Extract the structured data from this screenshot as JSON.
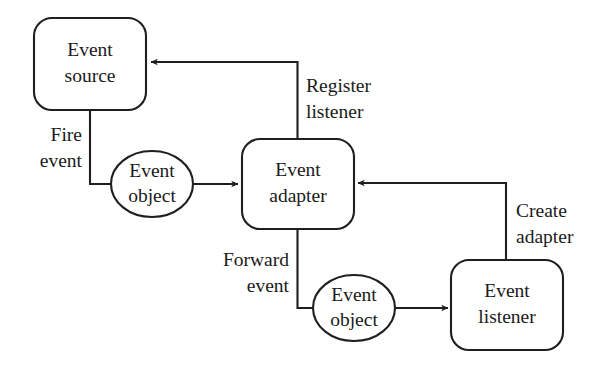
{
  "diagram": {
    "type": "flow-diagram",
    "background_color": "#ffffff",
    "line_color": "#1f1f1f",
    "text_color": "#1a1a1a",
    "nodes": [
      {
        "id": "event-source",
        "shape": "rounded-rectangle",
        "line1": "Event",
        "line2": "source"
      },
      {
        "id": "event-adapter",
        "shape": "rounded-rectangle",
        "line1": "Event",
        "line2": "adapter"
      },
      {
        "id": "event-listener",
        "shape": "rounded-rectangle",
        "line1": "Event",
        "line2": "listener"
      },
      {
        "id": "event-object-upper",
        "shape": "ellipse",
        "line1": "Event",
        "line2": "object"
      },
      {
        "id": "event-object-lower",
        "shape": "ellipse",
        "line1": "Event",
        "line2": "object"
      }
    ],
    "edges": [
      {
        "id": "fire-event",
        "from": "event-source",
        "to": "event-object-upper",
        "line1": "Fire",
        "line2": "event",
        "arrowhead": false
      },
      {
        "id": "object-to-adapter",
        "from": "event-object-upper",
        "to": "event-adapter",
        "label": "",
        "arrowhead": true
      },
      {
        "id": "register-listener",
        "from": "event-adapter",
        "to": "event-source",
        "line1": "Register",
        "line2": "listener",
        "arrowhead": true
      },
      {
        "id": "create-adapter",
        "from": "event-listener",
        "to": "event-adapter",
        "line1": "Create",
        "line2": "adapter",
        "arrowhead": true
      },
      {
        "id": "forward-event",
        "from": "event-adapter",
        "to": "event-object-lower",
        "line1": "Forward",
        "line2": "event",
        "arrowhead": false
      },
      {
        "id": "object-to-listener",
        "from": "event-object-lower",
        "to": "event-listener",
        "label": "",
        "arrowhead": true
      }
    ]
  }
}
